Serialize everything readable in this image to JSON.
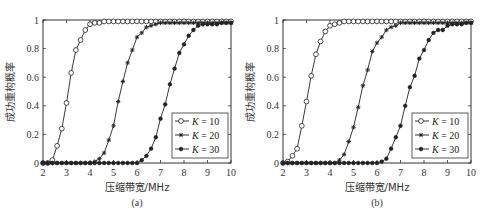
{
  "figure": {
    "panels": [
      {
        "caption": "(a)"
      },
      {
        "caption": "(b)"
      }
    ]
  },
  "chart_data": [
    {
      "type": "line",
      "title": "",
      "caption": "(a)",
      "xlabel": "压缩带宽/MHz",
      "ylabel": "成功重构概率",
      "xlim": [
        2,
        10
      ],
      "ylim": [
        0,
        1
      ],
      "xticks": [
        2,
        3,
        4,
        5,
        6,
        7,
        8,
        9,
        10
      ],
      "yticks": [
        0,
        0.2,
        0.4,
        0.6,
        0.8,
        1
      ],
      "ytick_labels": [
        "0",
        "0.2",
        "0.4",
        "0.6",
        "0.8",
        "1"
      ],
      "grid": false,
      "legend_position": "lower right",
      "x": [
        2.0,
        2.2,
        2.4,
        2.6,
        2.8,
        3.0,
        3.2,
        3.4,
        3.6,
        3.8,
        4.0,
        4.2,
        4.4,
        4.6,
        4.8,
        5.0,
        5.2,
        5.4,
        5.6,
        5.8,
        6.0,
        6.2,
        6.4,
        6.6,
        6.8,
        7.0,
        7.2,
        7.4,
        7.6,
        7.8,
        8.0,
        8.2,
        8.4,
        8.6,
        8.8,
        9.0,
        9.2,
        9.4,
        9.6,
        9.8,
        10.0
      ],
      "series": [
        {
          "name": "K = 10",
          "marker": "open-circle",
          "values": [
            0,
            0,
            0.02,
            0.12,
            0.24,
            0.42,
            0.63,
            0.79,
            0.86,
            0.93,
            0.97,
            0.98,
            0.98,
            0.99,
            0.99,
            0.99,
            0.99,
            0.99,
            0.99,
            0.99,
            0.99,
            0.99,
            0.99,
            0.99,
            0.99,
            0.99,
            0.99,
            0.99,
            0.99,
            0.99,
            0.99,
            0.99,
            0.99,
            0.99,
            0.99,
            0.99,
            0.99,
            0.99,
            0.99,
            0.99,
            0.99
          ]
        },
        {
          "name": "K = 20",
          "marker": "star",
          "values": [
            0,
            0,
            0,
            0,
            0,
            0,
            0,
            0,
            0,
            0,
            0,
            0.01,
            0.03,
            0.07,
            0.16,
            0.26,
            0.43,
            0.57,
            0.7,
            0.79,
            0.88,
            0.91,
            0.95,
            0.96,
            0.97,
            0.98,
            0.98,
            0.98,
            0.98,
            0.98,
            0.98,
            0.98,
            0.98,
            0.98,
            0.98,
            0.98,
            0.98,
            0.98,
            0.98,
            0.98,
            0.98
          ]
        },
        {
          "name": "K = 30",
          "marker": "filled-dot",
          "values": [
            0,
            0,
            0,
            0,
            0,
            0,
            0,
            0,
            0,
            0,
            0,
            0,
            0,
            0,
            0,
            0,
            0,
            0,
            0,
            0,
            0,
            0.02,
            0.05,
            0.1,
            0.18,
            0.31,
            0.41,
            0.55,
            0.66,
            0.77,
            0.83,
            0.89,
            0.93,
            0.96,
            0.97,
            0.97,
            0.97,
            0.97,
            0.98,
            0.98,
            0.98
          ]
        }
      ]
    },
    {
      "type": "line",
      "title": "",
      "caption": "(b)",
      "xlabel": "压缩带宽/MHz",
      "ylabel": "成功重构概率",
      "xlim": [
        2,
        10
      ],
      "ylim": [
        0,
        1
      ],
      "xticks": [
        2,
        3,
        4,
        5,
        6,
        7,
        8,
        9,
        10
      ],
      "yticks": [
        0,
        0.2,
        0.4,
        0.6,
        0.8,
        1
      ],
      "ytick_labels": [
        "0",
        "0.2",
        "0.4",
        "0.6",
        "0.8",
        "1"
      ],
      "grid": false,
      "legend_position": "lower right",
      "x": [
        2.0,
        2.2,
        2.4,
        2.6,
        2.8,
        3.0,
        3.2,
        3.4,
        3.6,
        3.8,
        4.0,
        4.2,
        4.4,
        4.6,
        4.8,
        5.0,
        5.2,
        5.4,
        5.6,
        5.8,
        6.0,
        6.2,
        6.4,
        6.6,
        6.8,
        7.0,
        7.2,
        7.4,
        7.6,
        7.8,
        8.0,
        8.2,
        8.4,
        8.6,
        8.8,
        9.0,
        9.2,
        9.4,
        9.6,
        9.8,
        10.0
      ],
      "series": [
        {
          "name": "K = 10",
          "marker": "open-circle",
          "values": [
            0,
            0.01,
            0.05,
            0.1,
            0.26,
            0.43,
            0.61,
            0.76,
            0.85,
            0.92,
            0.96,
            0.97,
            0.98,
            0.99,
            0.99,
            0.99,
            0.99,
            0.99,
            0.99,
            0.99,
            0.99,
            0.99,
            0.99,
            0.99,
            0.99,
            0.99,
            0.99,
            0.99,
            0.99,
            0.99,
            0.99,
            0.99,
            0.99,
            0.99,
            0.99,
            0.99,
            0.99,
            0.99,
            0.99,
            0.99,
            0.99
          ]
        },
        {
          "name": "K = 20",
          "marker": "star",
          "values": [
            0,
            0,
            0,
            0,
            0,
            0,
            0,
            0,
            0,
            0,
            0,
            0,
            0.02,
            0.06,
            0.15,
            0.25,
            0.39,
            0.54,
            0.65,
            0.78,
            0.84,
            0.88,
            0.93,
            0.95,
            0.96,
            0.98,
            0.98,
            0.98,
            0.98,
            0.98,
            0.98,
            0.98,
            0.98,
            0.98,
            0.98,
            0.98,
            0.98,
            0.98,
            0.98,
            0.98,
            0.98
          ]
        },
        {
          "name": "K = 30",
          "marker": "filled-dot",
          "values": [
            0,
            0,
            0,
            0,
            0,
            0,
            0,
            0,
            0,
            0,
            0,
            0,
            0,
            0,
            0,
            0,
            0,
            0,
            0,
            0,
            0,
            0.01,
            0.03,
            0.1,
            0.18,
            0.26,
            0.4,
            0.53,
            0.61,
            0.73,
            0.79,
            0.86,
            0.91,
            0.93,
            0.93,
            0.96,
            0.97,
            0.97,
            0.97,
            0.98,
            0.98
          ]
        }
      ]
    }
  ]
}
